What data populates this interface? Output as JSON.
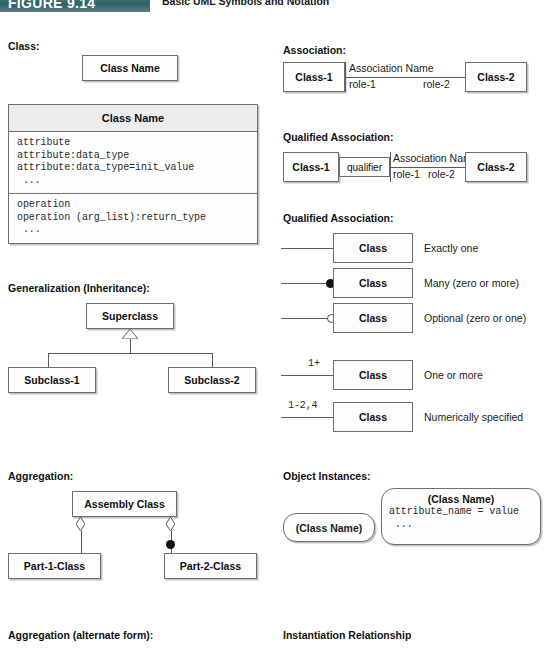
{
  "figure": {
    "number": "FIGURE 9.14",
    "title": "Basic UML Symbols and Notation"
  },
  "sections": {
    "class": "Class:",
    "generalization": "Generalization (Inheritance):",
    "aggregation": "Aggregation:",
    "aggregation_alt": "Aggregation (alternate form):",
    "association": "Association:",
    "qualified_association": "Qualified Association:",
    "qualified_association_2": "Qualified Association:",
    "object_instances": "Object Instances:",
    "instantiation": "Instantiation Relationship"
  },
  "class_simple": {
    "name": "Class Name"
  },
  "class_full": {
    "name": "Class Name",
    "attributes": [
      "attribute",
      "attribute:data_type",
      "attribute:data_type=init_value",
      " ..."
    ],
    "operations": [
      "operation",
      "operation (arg_list):return_type",
      " ..."
    ]
  },
  "generalization": {
    "super": "Superclass",
    "sub1": "Subclass-1",
    "sub2": "Subclass-2"
  },
  "aggregation": {
    "assembly": "Assembly Class",
    "part1": "Part-1-Class",
    "part2": "Part-2-Class"
  },
  "association": {
    "class1": "Class-1",
    "class2": "Class-2",
    "name": "Association Name",
    "role1": "role-1",
    "role2": "role-2"
  },
  "qualified_association": {
    "class1": "Class-1",
    "class2": "Class-2",
    "qualifier": "qualifier",
    "name": "Association Name",
    "role1": "role-1",
    "role2": "role-2"
  },
  "multiplicity": {
    "rows": [
      {
        "adornment": "",
        "marker": "none",
        "class_label": "Class",
        "description": "Exactly one"
      },
      {
        "adornment": "",
        "marker": "filled",
        "class_label": "Class",
        "description": "Many (zero or more)"
      },
      {
        "adornment": "",
        "marker": "hollow",
        "class_label": "Class",
        "description": "Optional (zero or one)"
      },
      {
        "adornment": "1+",
        "marker": "none",
        "class_label": "Class",
        "description": "One or more"
      },
      {
        "adornment": "1-2,4",
        "marker": "none",
        "class_label": "Class",
        "description": "Numerically specified"
      }
    ]
  },
  "object_instances": {
    "simple": "(Class Name)",
    "detailed_title": "(Class Name)",
    "detailed_lines": [
      "attribute_name = value",
      " ..."
    ]
  },
  "colors": {
    "banner": "#2f6165",
    "border": "#6d6d6d",
    "compartment_header": "#ececec",
    "text": "#111111"
  }
}
